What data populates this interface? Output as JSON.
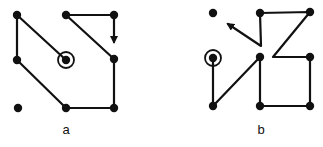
{
  "diagrams": [
    {
      "label": "a",
      "label_pos": [
        66,
        134
      ],
      "nodes": [
        {
          "id": "tl",
          "x": 17,
          "y": 15
        },
        {
          "id": "tm",
          "x": 66,
          "y": 15
        },
        {
          "id": "tr",
          "x": 114,
          "y": 15
        },
        {
          "id": "ml",
          "x": 17,
          "y": 60
        },
        {
          "id": "c",
          "x": 66,
          "y": 60,
          "circled": true
        },
        {
          "id": "mr",
          "x": 114,
          "y": 59
        },
        {
          "id": "bl",
          "x": 18,
          "y": 108
        },
        {
          "id": "bm",
          "x": 66,
          "y": 108
        },
        {
          "id": "br",
          "x": 114,
          "y": 108
        }
      ],
      "paths": [
        {
          "points": [
            [
              66,
              60
            ],
            [
              17,
              15
            ],
            [
              17,
              60
            ],
            [
              66,
              108
            ],
            [
              114,
              108
            ],
            [
              114,
              59
            ],
            [
              66,
              15
            ],
            [
              114,
              15
            ],
            [
              114,
              42
            ]
          ],
          "arrow_end": true
        }
      ]
    },
    {
      "label": "b",
      "label_pos": [
        261,
        134
      ],
      "nodes": [
        {
          "id": "tl",
          "x": 213,
          "y": 13
        },
        {
          "id": "tm",
          "x": 260,
          "y": 13
        },
        {
          "id": "tr",
          "x": 310,
          "y": 12
        },
        {
          "id": "ml",
          "x": 213,
          "y": 58,
          "circled": true
        },
        {
          "id": "mm",
          "x": 260,
          "y": 57
        },
        {
          "id": "mr",
          "x": 310,
          "y": 57
        },
        {
          "id": "bl",
          "x": 213,
          "y": 106
        },
        {
          "id": "bm",
          "x": 260,
          "y": 106
        },
        {
          "id": "br",
          "x": 310,
          "y": 106
        }
      ],
      "paths": [
        {
          "points": [
            [
              213,
              58
            ],
            [
              213,
              106
            ],
            [
              260,
              57
            ],
            [
              260,
              106
            ],
            [
              310,
              106
            ],
            [
              310,
              57
            ],
            [
              273,
              57
            ],
            [
              310,
              12
            ],
            [
              260,
              13
            ],
            [
              261,
              46
            ],
            [
              228,
              24
            ]
          ],
          "arrow_end": true
        }
      ]
    }
  ]
}
